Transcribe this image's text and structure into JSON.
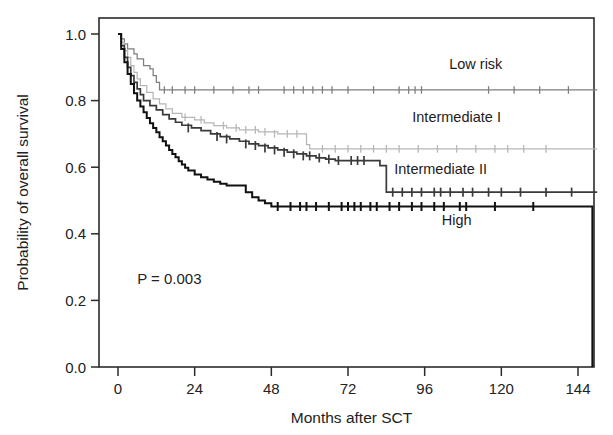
{
  "chart_data": {
    "type": "line",
    "subtype": "kaplan-meier-survival",
    "title": "",
    "xlabel": "Months after SCT",
    "ylabel": "Probability of overall survival",
    "xlim": [
      -4,
      152
    ],
    "ylim": [
      0.0,
      1.04
    ],
    "xticks": [
      0,
      24,
      48,
      72,
      96,
      120,
      144
    ],
    "xticklabels": [
      "0",
      "24",
      "48",
      "72",
      "96",
      "120",
      "144"
    ],
    "yticks": [
      0.0,
      0.2,
      0.4,
      0.6,
      0.8,
      1.0
    ],
    "yticklabels": [
      "0.0",
      "0.2",
      "0.4",
      "0.6",
      "0.8",
      "1.0"
    ],
    "grid": false,
    "legend_position": "inline-right-of-curves",
    "annotations": [
      {
        "text": "P = 0.003",
        "x": 6,
        "y": 0.25
      }
    ],
    "series": [
      {
        "name": "Low risk",
        "color": "#7e7e7e",
        "stroke_width": 1.25,
        "label_x": 112,
        "label_y": 0.895,
        "steps": [
          [
            0,
            1.0
          ],
          [
            1,
            0.985
          ],
          [
            2,
            0.97
          ],
          [
            3,
            0.955
          ],
          [
            5,
            0.94
          ],
          [
            6,
            0.925
          ],
          [
            8,
            0.905
          ],
          [
            10,
            0.895
          ],
          [
            11,
            0.875
          ],
          [
            12,
            0.855
          ],
          [
            13,
            0.832
          ],
          [
            150,
            0.832
          ]
        ],
        "censors": [
          [
            14.5,
            0.832
          ],
          [
            17,
            0.832
          ],
          [
            21,
            0.832
          ],
          [
            24,
            0.832
          ],
          [
            30,
            0.832
          ],
          [
            36,
            0.832
          ],
          [
            41,
            0.832
          ],
          [
            44,
            0.832
          ],
          [
            52,
            0.832
          ],
          [
            55,
            0.832
          ],
          [
            58,
            0.832
          ],
          [
            61,
            0.832
          ],
          [
            64,
            0.832
          ],
          [
            67,
            0.832
          ],
          [
            72,
            0.832
          ],
          [
            80,
            0.832
          ],
          [
            88,
            0.832
          ],
          [
            91,
            0.832
          ],
          [
            93,
            0.832
          ],
          [
            95,
            0.832
          ],
          [
            116,
            0.832
          ],
          [
            124,
            0.832
          ],
          [
            132,
            0.832
          ],
          [
            141,
            0.832
          ]
        ]
      },
      {
        "name": "Intermediate I",
        "color": "#b6b6b6",
        "stroke_width": 1.25,
        "label_x": 106,
        "label_y": 0.735,
        "steps": [
          [
            0,
            1.0
          ],
          [
            1,
            0.975
          ],
          [
            2,
            0.95
          ],
          [
            3,
            0.93
          ],
          [
            4,
            0.905
          ],
          [
            5,
            0.885
          ],
          [
            6,
            0.865
          ],
          [
            7,
            0.845
          ],
          [
            9,
            0.825
          ],
          [
            11,
            0.805
          ],
          [
            13,
            0.79
          ],
          [
            15,
            0.775
          ],
          [
            17,
            0.762
          ],
          [
            20,
            0.75
          ],
          [
            24,
            0.742
          ],
          [
            27,
            0.733
          ],
          [
            30,
            0.725
          ],
          [
            34,
            0.718
          ],
          [
            38,
            0.712
          ],
          [
            44,
            0.706
          ],
          [
            50,
            0.7
          ],
          [
            58,
            0.7
          ],
          [
            59,
            0.668
          ],
          [
            60,
            0.655
          ],
          [
            150,
            0.655
          ]
        ],
        "censors": [
          [
            21,
            0.75
          ],
          [
            26,
            0.742
          ],
          [
            33,
            0.725
          ],
          [
            37,
            0.718
          ],
          [
            40,
            0.712
          ],
          [
            43,
            0.712
          ],
          [
            46,
            0.706
          ],
          [
            49,
            0.7
          ],
          [
            53,
            0.7
          ],
          [
            56,
            0.7
          ],
          [
            64,
            0.655
          ],
          [
            68,
            0.655
          ],
          [
            72,
            0.655
          ],
          [
            76,
            0.655
          ],
          [
            80,
            0.655
          ],
          [
            84,
            0.655
          ],
          [
            88,
            0.655
          ],
          [
            94,
            0.655
          ],
          [
            100,
            0.655
          ],
          [
            106,
            0.655
          ],
          [
            112,
            0.655
          ],
          [
            118,
            0.655
          ],
          [
            122,
            0.655
          ],
          [
            127,
            0.655
          ],
          [
            134,
            0.655
          ]
        ]
      },
      {
        "name": "Intermediate II",
        "color": "#3a3a3a",
        "stroke_width": 1.7,
        "label_x": 101,
        "label_y": 0.58,
        "steps": [
          [
            0,
            1.0
          ],
          [
            1,
            0.965
          ],
          [
            2,
            0.93
          ],
          [
            3,
            0.9
          ],
          [
            4,
            0.875
          ],
          [
            5,
            0.855
          ],
          [
            6,
            0.835
          ],
          [
            7,
            0.818
          ],
          [
            8,
            0.8
          ],
          [
            10,
            0.785
          ],
          [
            12,
            0.772
          ],
          [
            14,
            0.758
          ],
          [
            16,
            0.745
          ],
          [
            18,
            0.735
          ],
          [
            20,
            0.726
          ],
          [
            23,
            0.718
          ],
          [
            26,
            0.71
          ],
          [
            29,
            0.7
          ],
          [
            32,
            0.692
          ],
          [
            35,
            0.685
          ],
          [
            38,
            0.678
          ],
          [
            41,
            0.67
          ],
          [
            44,
            0.665
          ],
          [
            47,
            0.658
          ],
          [
            50,
            0.652
          ],
          [
            53,
            0.645
          ],
          [
            56,
            0.64
          ],
          [
            59,
            0.634
          ],
          [
            62,
            0.628
          ],
          [
            65,
            0.624
          ],
          [
            68,
            0.62
          ],
          [
            71,
            0.62
          ],
          [
            78,
            0.62
          ],
          [
            82,
            0.605
          ],
          [
            84,
            0.525
          ],
          [
            150,
            0.525
          ]
        ],
        "censors": [
          [
            22,
            0.718
          ],
          [
            31,
            0.692
          ],
          [
            34,
            0.685
          ],
          [
            40,
            0.67
          ],
          [
            43,
            0.665
          ],
          [
            46,
            0.658
          ],
          [
            49,
            0.652
          ],
          [
            52,
            0.645
          ],
          [
            55,
            0.64
          ],
          [
            58,
            0.634
          ],
          [
            60,
            0.634
          ],
          [
            63,
            0.628
          ],
          [
            66,
            0.624
          ],
          [
            69,
            0.62
          ],
          [
            73,
            0.62
          ],
          [
            75,
            0.62
          ],
          [
            77,
            0.62
          ],
          [
            86,
            0.525
          ],
          [
            89,
            0.525
          ],
          [
            92,
            0.525
          ],
          [
            95,
            0.525
          ],
          [
            99,
            0.525
          ],
          [
            101,
            0.525
          ],
          [
            104,
            0.525
          ],
          [
            108,
            0.525
          ],
          [
            111,
            0.525
          ],
          [
            116,
            0.525
          ],
          [
            120,
            0.525
          ],
          [
            126,
            0.525
          ],
          [
            134,
            0.525
          ],
          [
            142,
            0.525
          ]
        ]
      },
      {
        "name": "High",
        "color": "#111111",
        "stroke_width": 2.0,
        "label_x": 106,
        "label_y": 0.425,
        "steps": [
          [
            0,
            1.0
          ],
          [
            1,
            0.955
          ],
          [
            2,
            0.915
          ],
          [
            3,
            0.88
          ],
          [
            4,
            0.85
          ],
          [
            5,
            0.822
          ],
          [
            6,
            0.8
          ],
          [
            7,
            0.782
          ],
          [
            8,
            0.765
          ],
          [
            9,
            0.748
          ],
          [
            10,
            0.732
          ],
          [
            11,
            0.718
          ],
          [
            12,
            0.705
          ],
          [
            13,
            0.69
          ],
          [
            14,
            0.678
          ],
          [
            15,
            0.665
          ],
          [
            16,
            0.652
          ],
          [
            17,
            0.64
          ],
          [
            18,
            0.63
          ],
          [
            19,
            0.618
          ],
          [
            20,
            0.608
          ],
          [
            21,
            0.598
          ],
          [
            22,
            0.59
          ],
          [
            24,
            0.578
          ],
          [
            26,
            0.57
          ],
          [
            28,
            0.563
          ],
          [
            30,
            0.556
          ],
          [
            32,
            0.55
          ],
          [
            34,
            0.545
          ],
          [
            38,
            0.545
          ],
          [
            40,
            0.525
          ],
          [
            42,
            0.51
          ],
          [
            44,
            0.5
          ],
          [
            46,
            0.492
          ],
          [
            48,
            0.482
          ],
          [
            148,
            0.482
          ],
          [
            148.5,
            0.0
          ]
        ],
        "censors": [
          [
            50,
            0.482
          ],
          [
            54,
            0.482
          ],
          [
            57,
            0.482
          ],
          [
            59,
            0.482
          ],
          [
            62,
            0.482
          ],
          [
            66,
            0.482
          ],
          [
            70,
            0.482
          ],
          [
            72,
            0.482
          ],
          [
            74,
            0.482
          ],
          [
            76,
            0.482
          ],
          [
            79,
            0.482
          ],
          [
            81,
            0.482
          ],
          [
            85,
            0.482
          ],
          [
            88,
            0.482
          ],
          [
            92,
            0.482
          ],
          [
            95,
            0.482
          ],
          [
            99,
            0.482
          ],
          [
            102,
            0.482
          ],
          [
            107,
            0.482
          ],
          [
            109,
            0.482
          ],
          [
            118,
            0.482
          ],
          [
            130,
            0.482
          ]
        ]
      }
    ]
  },
  "axes": {
    "x_title": "Months after SCT",
    "y_title": "Probability of overall survival"
  },
  "annotation": {
    "pvalue": "P = 0.003"
  },
  "labels": {
    "low_risk": "Low risk",
    "intermediate_1": "Intermediate I",
    "intermediate_2": "Intermediate II",
    "high": "High"
  }
}
